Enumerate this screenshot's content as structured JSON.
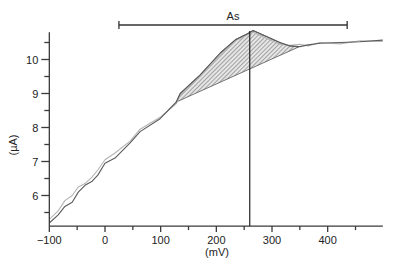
{
  "chart_data": {
    "type": "line",
    "title": "",
    "xlabel": "(mV)",
    "ylabel": "(µA)",
    "xlim": [
      -100,
      500
    ],
    "ylim": [
      5.1,
      10.8
    ],
    "grid": false,
    "legend": null,
    "x_ticks": {
      "values": [
        -100,
        0,
        100,
        200,
        300,
        400
      ],
      "labels": [
        "−100",
        "0",
        "100",
        "200",
        "300",
        "400"
      ],
      "minor": [
        -50,
        50,
        150,
        250,
        350,
        450
      ]
    },
    "y_ticks": {
      "values": [
        6,
        7,
        8,
        9,
        10
      ],
      "labels": [
        "6",
        "7",
        "8",
        "9",
        "10"
      ],
      "minor": [
        5.5,
        6.5,
        7.5,
        8.5,
        9.5,
        10.5
      ]
    },
    "x": [
      -100,
      -84,
      -72,
      -59,
      -48,
      -36,
      -23,
      -13,
      0,
      18,
      45,
      63,
      99,
      128,
      135,
      171,
      207,
      234,
      255,
      266,
      287,
      314,
      332,
      350,
      365,
      386,
      422,
      458,
      499
    ],
    "series": [
      {
        "name": "trace-1",
        "color": "#5a5a5a",
        "values": [
          5.19,
          5.43,
          5.68,
          5.8,
          6.1,
          6.3,
          6.42,
          6.6,
          6.95,
          7.1,
          7.55,
          7.88,
          8.26,
          8.75,
          9.0,
          9.55,
          10.19,
          10.58,
          10.75,
          10.85,
          10.7,
          10.5,
          10.4,
          10.38,
          10.43,
          10.48,
          10.5,
          10.52,
          10.57
        ]
      },
      {
        "name": "trace-2",
        "color": "#b4b4b4",
        "values": [
          5.3,
          5.55,
          5.85,
          6.0,
          6.25,
          6.35,
          6.55,
          6.75,
          7.05,
          7.25,
          7.6,
          7.95,
          8.3,
          8.7,
          8.95,
          9.5,
          10.15,
          10.55,
          10.72,
          10.8,
          10.65,
          10.45,
          10.42,
          10.45,
          10.4,
          10.5,
          10.46,
          10.55,
          10.53
        ]
      }
    ],
    "shaded_region": {
      "label": "hatched area above baseline",
      "baseline_start": [
        128,
        8.75
      ],
      "baseline_end": [
        348,
        10.37
      ],
      "x_range": [
        128,
        348
      ]
    },
    "vertical_marker": {
      "x": 260
    },
    "annotations": [
      {
        "type": "bracket",
        "text": "As",
        "x_start": 25,
        "x_end": 435
      }
    ]
  }
}
